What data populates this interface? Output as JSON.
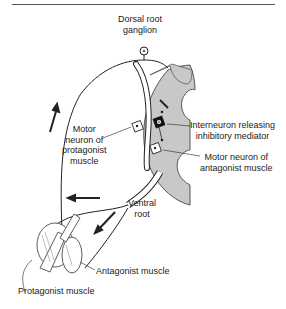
{
  "diagram": {
    "type": "reflex-arc",
    "colors": {
      "gray_matter": "#c8c8c8",
      "line": "#222222",
      "interneuron": "#111111"
    },
    "labels": {
      "dorsal_root_ganglion_1": "Dorsal root",
      "dorsal_root_ganglion_2": "ganglion",
      "interneuron_1": "Interneuron releasing",
      "interneuron_2": "inhibitory mediator",
      "motor_protagonist_1": "Motor",
      "motor_protagonist_2": "neuron of",
      "motor_protagonist_3": "protagonist",
      "motor_protagonist_4": "muscle",
      "motor_antagonist_1": "Motor neuron of",
      "motor_antagonist_2": "antagonist muscle",
      "ventral_root_1": "Ventral",
      "ventral_root_2": "root",
      "antagonist_muscle": "Antagonist muscle",
      "protagonist_muscle": "Protagonist muscle"
    }
  }
}
